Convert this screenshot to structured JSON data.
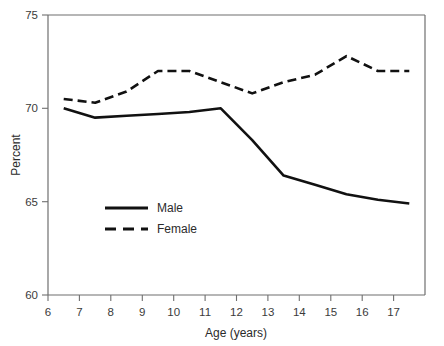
{
  "chart_data": {
    "type": "line",
    "title": "",
    "xlabel": "Age (years)",
    "ylabel": "Percent",
    "xlim": [
      6,
      18
    ],
    "ylim": [
      60,
      75
    ],
    "xticks": [
      6,
      7,
      8,
      9,
      10,
      11,
      12,
      13,
      14,
      15,
      16,
      17
    ],
    "xtick_labels": [
      "6",
      "7",
      "8",
      "9",
      "10",
      "11",
      "12",
      "13",
      "14",
      "15",
      "16",
      "17"
    ],
    "yticks": [
      60,
      65,
      70,
      75
    ],
    "ytick_labels": [
      "60",
      "65",
      "70",
      "75"
    ],
    "grid": false,
    "legend_position": "center-left",
    "x": [
      6.5,
      7.5,
      8.5,
      9.5,
      10.5,
      11.5,
      12.5,
      13.5,
      14.5,
      15.5,
      16.5,
      17.5
    ],
    "series": [
      {
        "name": "Male",
        "style": "solid",
        "color": "#111111",
        "values": [
          70.0,
          69.5,
          69.6,
          69.7,
          69.8,
          70.0,
          68.3,
          66.4,
          65.9,
          65.4,
          65.1,
          64.9
        ]
      },
      {
        "name": "Female",
        "style": "dashed",
        "color": "#111111",
        "values": [
          70.5,
          70.3,
          70.9,
          72.0,
          72.0,
          71.4,
          70.8,
          71.4,
          71.8,
          72.8,
          72.0,
          72.0
        ]
      }
    ]
  },
  "legend": {
    "items": [
      {
        "label": "Male",
        "style": "solid"
      },
      {
        "label": "Female",
        "style": "dashed"
      }
    ]
  },
  "axes": {
    "x_title": "Age (years)",
    "y_title": "Percent"
  }
}
